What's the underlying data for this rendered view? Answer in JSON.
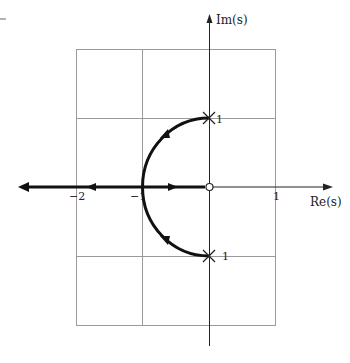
{
  "diagram": {
    "type": "root-locus",
    "axes": {
      "x_label": "Re(s)",
      "y_label": "Im(s)",
      "x_ticks": [
        {
          "value": -2,
          "label": "−2"
        },
        {
          "value": -1,
          "label": "−1"
        },
        {
          "value": 1,
          "label": "1"
        }
      ]
    },
    "poles": [
      {
        "re": 0,
        "im": 1,
        "label": "1",
        "marker": "x"
      },
      {
        "re": 0,
        "im": -1,
        "label": "1",
        "marker": "x"
      }
    ],
    "zeros": [
      {
        "re": 0,
        "im": 0,
        "marker": "o"
      }
    ],
    "branches": [
      {
        "description": "upper arc from pole j1 to breakaway at -1",
        "direction": "toward -1"
      },
      {
        "description": "lower arc from pole -j1 to breakaway at -1",
        "direction": "toward -1"
      },
      {
        "description": "real axis from -1 to zero at origin",
        "direction": "right"
      },
      {
        "description": "real axis from -1 to -infinity",
        "direction": "left"
      }
    ],
    "grid": {
      "x_range": [
        -2,
        1
      ],
      "y_range": [
        -2,
        2
      ],
      "spacing": 1
    },
    "colors": {
      "locus": "#111111",
      "grid": "#999999",
      "axes": "#222222"
    }
  }
}
